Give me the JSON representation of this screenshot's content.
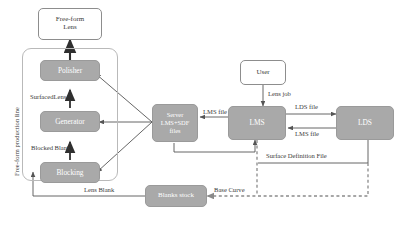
{
  "diagram": {
    "colors": {
      "node_fill": "#a9a9a9",
      "node_outline_fill": "#ffffff",
      "node_border": "#8d8d8d",
      "group_border": "#b9b9b9",
      "edge": "#555555",
      "edge_dashed": "#8a8a8a",
      "text_dark": "#3a3a3a",
      "text_light": "#ffffff",
      "background": "#ffffff"
    },
    "group": {
      "label": "Free-form production line"
    },
    "nodes": {
      "free_form_lens": "Free-form\nLens",
      "free_form_lens_line1": "Free-form",
      "free_form_lens_line2": "Lens",
      "polisher": "Polisher",
      "generator": "Generator",
      "blocking": "Blocking",
      "server_line1": "Server",
      "server_line2": "LMS+SDF",
      "server_line3": "files",
      "lms": "LMS",
      "lds": "LDS",
      "user": "User",
      "blanks_stock": "Blanks stock"
    },
    "edge_labels": {
      "surfaced_lens": "SurfacedLens",
      "blocked_blank": "Blocked Blank",
      "lms_file_left": "LMS file",
      "lens_job": "Lens job",
      "lds_file": "LDS file",
      "lms_file_right": "LMS file",
      "surface_definition_file": "Surface Definition File",
      "lens_blank": "Lens Blank",
      "base_curve": "Base Curve"
    }
  }
}
